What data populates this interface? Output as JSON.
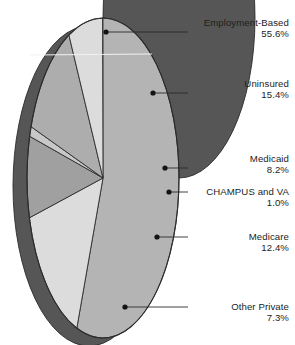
{
  "chart_data": {
    "type": "pie",
    "title": "",
    "subtitle": "",
    "xlabel": "",
    "ylabel": "",
    "legend_position": "callout-labels-right",
    "grid": false,
    "style": "3d-pie",
    "unit": "%",
    "categories": [
      "Employment-Based",
      "Uninsured",
      "Medicaid",
      "CHAMPUS and VA",
      "Medicare",
      "Other Private"
    ],
    "values": [
      55.6,
      15.4,
      8.2,
      1.0,
      12.4,
      7.3
    ],
    "slices": [
      {
        "label": "Employment-Based",
        "percent_text": "55.6%",
        "value": 55.6,
        "color": "#b4b4b4",
        "start_deg": 0.0,
        "end_deg": 200.16
      },
      {
        "label": "Uninsured",
        "percent_text": "15.4%",
        "value": 15.4,
        "color": "#dcdcdc",
        "start_deg": 200.16,
        "end_deg": 255.6
      },
      {
        "label": "Medicaid",
        "percent_text": "8.2%",
        "value": 8.2,
        "color": "#a0a0a0",
        "start_deg": 255.6,
        "end_deg": 285.12
      },
      {
        "label": "CHAMPUS and VA",
        "percent_text": "1.0%",
        "value": 1.0,
        "color": "#c8c8c8",
        "start_deg": 285.12,
        "end_deg": 288.72
      },
      {
        "label": "Medicare",
        "percent_text": "12.4%",
        "value": 12.4,
        "color": "#adadad",
        "start_deg": 288.72,
        "end_deg": 333.36
      },
      {
        "label": "Other Private",
        "percent_text": "7.3%",
        "value": 7.3,
        "color": "#dcdcdc",
        "start_deg": 333.36,
        "end_deg": 359.64
      }
    ]
  },
  "callouts": [
    {
      "name": "Employment-Based",
      "percent": "55.6%"
    },
    {
      "name": "Uninsured",
      "percent": "15.4%"
    },
    {
      "name": "Medicaid",
      "percent": "8.2%"
    },
    {
      "name": "CHAMPUS and VA",
      "percent": "1.0%"
    },
    {
      "name": "Medicare",
      "percent": "12.4%"
    },
    {
      "name": "Other Private",
      "percent": "7.3%"
    }
  ],
  "colors": {
    "background": "#ffffff",
    "text": "#1d1d1d",
    "outline": "#2b2b2b",
    "leader_line": "#2b2b2b",
    "side_wall_dark": "#565656",
    "side_wall_darker": "#4a4a4a",
    "slice_light": "#dcdcdc",
    "slice_mid": "#b4b4b4",
    "slice_dark": "#a0a0a0"
  }
}
